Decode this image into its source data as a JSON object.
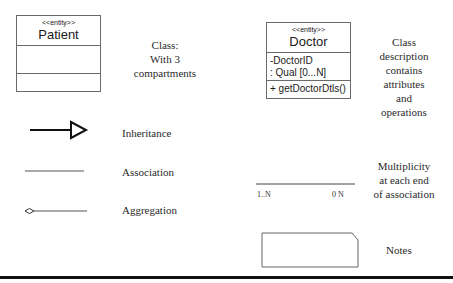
{
  "patient_class": {
    "stereotype": "<<entity>>",
    "name": "Patient",
    "attributes": [],
    "operations": []
  },
  "patient_description": {
    "lines": [
      "Class:",
      "With 3",
      "compartments"
    ]
  },
  "doctor_class": {
    "stereotype": "<<entity>>",
    "name": "Doctor",
    "attributes": [
      "-DoctorID",
      ":  Qual [0...N]"
    ],
    "operations": [
      "+ getDoctorDtls()"
    ]
  },
  "doctor_description": {
    "lines": [
      "Class",
      "description",
      "contains",
      "attributes",
      "and",
      "operations"
    ]
  },
  "relationships": {
    "inheritance": {
      "label": "Inheritance",
      "icon": "hollow-triangle-arrow-icon"
    },
    "association": {
      "label": "Association",
      "icon": "plain-line-icon"
    },
    "aggregation": {
      "label": "Aggregation",
      "icon": "hollow-diamond-line-icon"
    }
  },
  "multiplicity": {
    "left_label": "1..N",
    "right_label": "0 N",
    "description_lines": [
      "Multiplicity",
      "at each end",
      "of association"
    ]
  },
  "notes": {
    "label": "Notes",
    "icon": "note-folded-corner-icon"
  },
  "colors": {
    "stroke": "#6a6a6a",
    "text": "#2a2a2a",
    "rule": "#111111"
  }
}
